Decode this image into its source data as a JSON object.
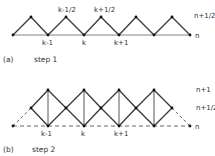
{
  "panel_a": {
    "caption_tag": "(a)",
    "caption_text": "step 1",
    "labels": {
      "k_minus_half": "k-1/2",
      "k_plus_half": "k+1/2",
      "n_plus_half": "n+1/2",
      "n": "n",
      "k_minus_1": "k-1",
      "k": "k",
      "k_plus_1": "k+1"
    }
  },
  "panel_b": {
    "caption_tag": "(b)",
    "caption_text": "step 2",
    "labels": {
      "n_plus_1": "n+1",
      "n_plus_half": "n+1/2",
      "n": "n",
      "k_minus_1": "k-1",
      "k": "k",
      "k_plus_1": "k+1"
    }
  },
  "colors": {
    "line": "#3a3a3a",
    "dot": "#111111",
    "text": "#333333"
  }
}
